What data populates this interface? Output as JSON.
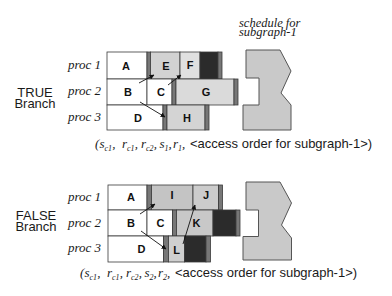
{
  "schedule_label": {
    "line1": "schedule for",
    "line2": "subgraph-1"
  },
  "colors": {
    "idle_white": "#ffffff",
    "comm_bar": "#777777",
    "busy_black": "#2b2b2b",
    "schedule_fill": "#c9c9c9"
  },
  "branches": [
    {
      "label_line1": "TRUE",
      "label_line2": "Branch",
      "procs": [
        "proc 1",
        "proc 2",
        "proc 3"
      ],
      "tasks": [
        {
          "name": "A",
          "proc": "proc 1",
          "color": "#ffffff"
        },
        {
          "name": "E",
          "proc": "proc 1",
          "color": "#d2d2d2"
        },
        {
          "name": "F",
          "proc": "proc 1",
          "color": "#e0e0e0"
        },
        {
          "name": "B",
          "proc": "proc 2",
          "color": "#ffffff"
        },
        {
          "name": "C",
          "proc": "proc 2",
          "color": "#ffffff"
        },
        {
          "name": "G",
          "proc": "proc 2",
          "color": "#dadada"
        },
        {
          "name": "D",
          "proc": "proc 3",
          "color": "#ffffff"
        },
        {
          "name": "H",
          "proc": "proc 3",
          "color": "#d4d4d4"
        }
      ],
      "arrows": [
        {
          "from": "B",
          "to": "E"
        },
        {
          "from": "C",
          "to": "F"
        },
        {
          "from": "B",
          "to": "H"
        }
      ],
      "caption": {
        "open": "(",
        "separator": ", ",
        "terms": [
          {
            "base": "s",
            "sub": "c1"
          },
          {
            "base": "r",
            "sub": "c1"
          },
          {
            "base": "r",
            "sub": "c2"
          },
          {
            "base": "s",
            "sub": "1"
          },
          {
            "base": "r",
            "sub": "1"
          }
        ],
        "tail": "<access order for subgraph-1>)"
      }
    },
    {
      "label_line1": "FALSE",
      "label_line2": "Branch",
      "procs": [
        "proc 1",
        "proc 2",
        "proc 3"
      ],
      "tasks": [
        {
          "name": "A",
          "proc": "proc 1",
          "color": "#ffffff"
        },
        {
          "name": "I",
          "proc": "proc 1",
          "color": "#c4c4c4"
        },
        {
          "name": "J",
          "proc": "proc 1",
          "color": "#cccccc"
        },
        {
          "name": "B",
          "proc": "proc 2",
          "color": "#ffffff"
        },
        {
          "name": "C",
          "proc": "proc 2",
          "color": "#ffffff"
        },
        {
          "name": "K",
          "proc": "proc 2",
          "color": "#c8c8c8"
        },
        {
          "name": "D",
          "proc": "proc 3",
          "color": "#ffffff"
        },
        {
          "name": "L",
          "proc": "proc 3",
          "color": "#cfcfcf"
        }
      ],
      "arrows": [
        {
          "from": "B",
          "to": "I"
        },
        {
          "from": "B",
          "to": "L"
        },
        {
          "from": "L",
          "to": "J"
        }
      ],
      "caption": {
        "open": "(",
        "separator": ", ",
        "terms": [
          {
            "base": "s",
            "sub": "c1"
          },
          {
            "base": "r",
            "sub": "c1"
          },
          {
            "base": "r",
            "sub": "c2"
          },
          {
            "base": "s",
            "sub": "2"
          },
          {
            "base": "r",
            "sub": "2"
          }
        ],
        "tail": "<access order for subgraph-1>)"
      }
    }
  ]
}
